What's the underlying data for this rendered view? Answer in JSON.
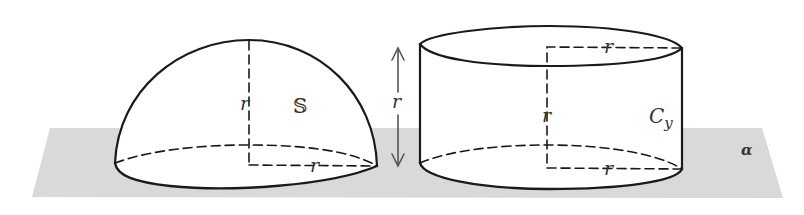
{
  "colors": {
    "background": "#ffffff",
    "plane": "#d9d9d9",
    "stroke": "#1a1a1a",
    "arrow": "#555555"
  },
  "plane": {
    "label": "α",
    "points": "50,128 762,128 783,198 32,197"
  },
  "hemisphere": {
    "label": "𝕊",
    "radius_vertical_label": "r",
    "radius_horizontal_label": "r"
  },
  "cylinder": {
    "label_main": "C",
    "label_sub": "y",
    "radius_top_label": "r",
    "height_inner_label": "r",
    "radius_bottom_label": "r"
  },
  "height_arrow": {
    "label": "r"
  }
}
